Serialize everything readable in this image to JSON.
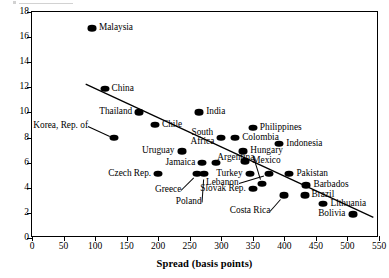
{
  "chart_data": {
    "type": "scatter",
    "title": "",
    "xlabel": "Spread (basis points)",
    "ylabel": "",
    "xlim": [
      0,
      550
    ],
    "ylim": [
      0,
      18
    ],
    "xticks": [
      0,
      50,
      100,
      150,
      200,
      250,
      300,
      350,
      400,
      450,
      500,
      550
    ],
    "yticks": [
      0,
      2,
      4,
      6,
      8,
      10,
      12,
      14,
      16,
      18
    ],
    "grid": false,
    "legend": "none",
    "marker_color": "#000000",
    "trendline": {
      "x0": 85,
      "y0": 12.2,
      "x1": 545,
      "y1": 1.5
    },
    "points": [
      {
        "name": "Malaysia",
        "x": 95,
        "y": 16.7,
        "label_pos": "right"
      },
      {
        "name": "China",
        "x": 115,
        "y": 11.9,
        "label_pos": "right"
      },
      {
        "name": "Thailand",
        "x": 170,
        "y": 10.0,
        "label_pos": "left"
      },
      {
        "name": "India",
        "x": 265,
        "y": 10.0,
        "label_pos": "right"
      },
      {
        "name": "Chile",
        "x": 195,
        "y": 9.0,
        "label_pos": "right"
      },
      {
        "name": "Korea, Rep. of",
        "x": 130,
        "y": 8.0,
        "label_pos": "leader"
      },
      {
        "name": "South Africa",
        "x": 300,
        "y": 8.0,
        "label_pos": "left"
      },
      {
        "name": "Colombia",
        "x": 322,
        "y": 8.0,
        "label_pos": "right"
      },
      {
        "name": "Philippines",
        "x": 350,
        "y": 8.8,
        "label_pos": "right"
      },
      {
        "name": "Uruguay",
        "x": 237,
        "y": 6.9,
        "label_pos": "left"
      },
      {
        "name": "Hungary",
        "x": 335,
        "y": 6.9,
        "label_pos": "right"
      },
      {
        "name": "Indonesia",
        "x": 392,
        "y": 7.5,
        "label_pos": "right"
      },
      {
        "name": "Jamaica",
        "x": 270,
        "y": 6.0,
        "label_pos": "left"
      },
      {
        "name": "Jamaica-b",
        "x": 292,
        "y": 6.0,
        "label_pos": "none"
      },
      {
        "name": "Mexico",
        "x": 338,
        "y": 6.1,
        "label_pos": "right"
      },
      {
        "name": "Argentina",
        "x": 365,
        "y": 4.3,
        "label_pos": "leader"
      },
      {
        "name": "Czech Rep.",
        "x": 200,
        "y": 5.1,
        "label_pos": "left"
      },
      {
        "name": "Greece",
        "x": 262,
        "y": 5.1,
        "label_pos": "leader"
      },
      {
        "name": "Poland",
        "x": 272,
        "y": 5.1,
        "label_pos": "leader"
      },
      {
        "name": "Turkey",
        "x": 345,
        "y": 5.1,
        "label_pos": "left"
      },
      {
        "name": "Lebanon",
        "x": 375,
        "y": 5.1,
        "label_pos": "leader"
      },
      {
        "name": "Pakistan",
        "x": 408,
        "y": 5.1,
        "label_pos": "right"
      },
      {
        "name": "Slovak Rep.",
        "x": 350,
        "y": 3.9,
        "label_pos": "left"
      },
      {
        "name": "Barbados",
        "x": 435,
        "y": 4.2,
        "label_pos": "right"
      },
      {
        "name": "Costa Rica",
        "x": 400,
        "y": 3.4,
        "label_pos": "leader"
      },
      {
        "name": "Brazil",
        "x": 432,
        "y": 3.4,
        "label_pos": "right"
      },
      {
        "name": "Lithuania",
        "x": 462,
        "y": 2.7,
        "label_pos": "right"
      },
      {
        "name": "Bolivia",
        "x": 508,
        "y": 1.9,
        "label_pos": "left"
      }
    ]
  }
}
